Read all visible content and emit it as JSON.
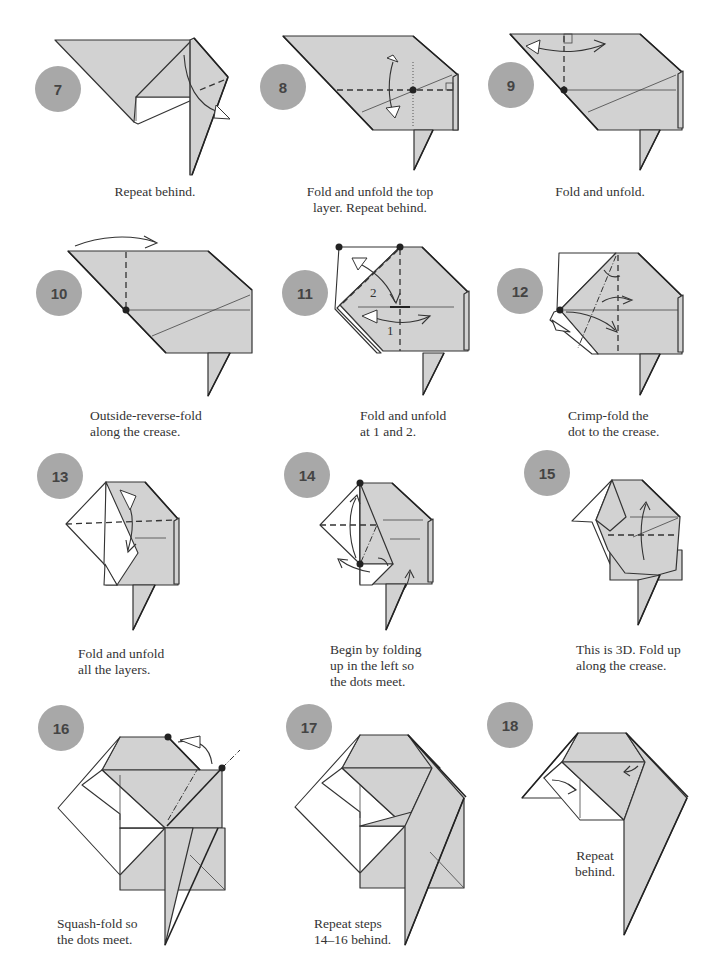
{
  "page": {
    "badge_color": "#a8a8a8",
    "paper_color": "#d2d2d2",
    "line_color": "#333333"
  },
  "steps": [
    {
      "number": "7",
      "caption": "Repeat behind."
    },
    {
      "number": "8",
      "caption": "Fold and unfold the top\nlayer. Repeat behind."
    },
    {
      "number": "9",
      "caption": "Fold and unfold."
    },
    {
      "number": "10",
      "caption": "Outside-reverse-fold\nalong the crease."
    },
    {
      "number": "11",
      "caption": "Fold and unfold\nat 1 and 2.",
      "labels": [
        "1",
        "2"
      ]
    },
    {
      "number": "12",
      "caption": "Crimp-fold the\ndot to the crease."
    },
    {
      "number": "13",
      "caption": "Fold and unfold\nall the layers."
    },
    {
      "number": "14",
      "caption": "Begin by folding\nup in the left so\nthe dots meet."
    },
    {
      "number": "15",
      "caption": "This is 3D. Fold up\nalong the crease."
    },
    {
      "number": "16",
      "caption": "Squash-fold so\nthe dots meet."
    },
    {
      "number": "17",
      "caption": "Repeat steps\n14–16 behind."
    },
    {
      "number": "18",
      "caption": "Repeat\nbehind."
    }
  ]
}
